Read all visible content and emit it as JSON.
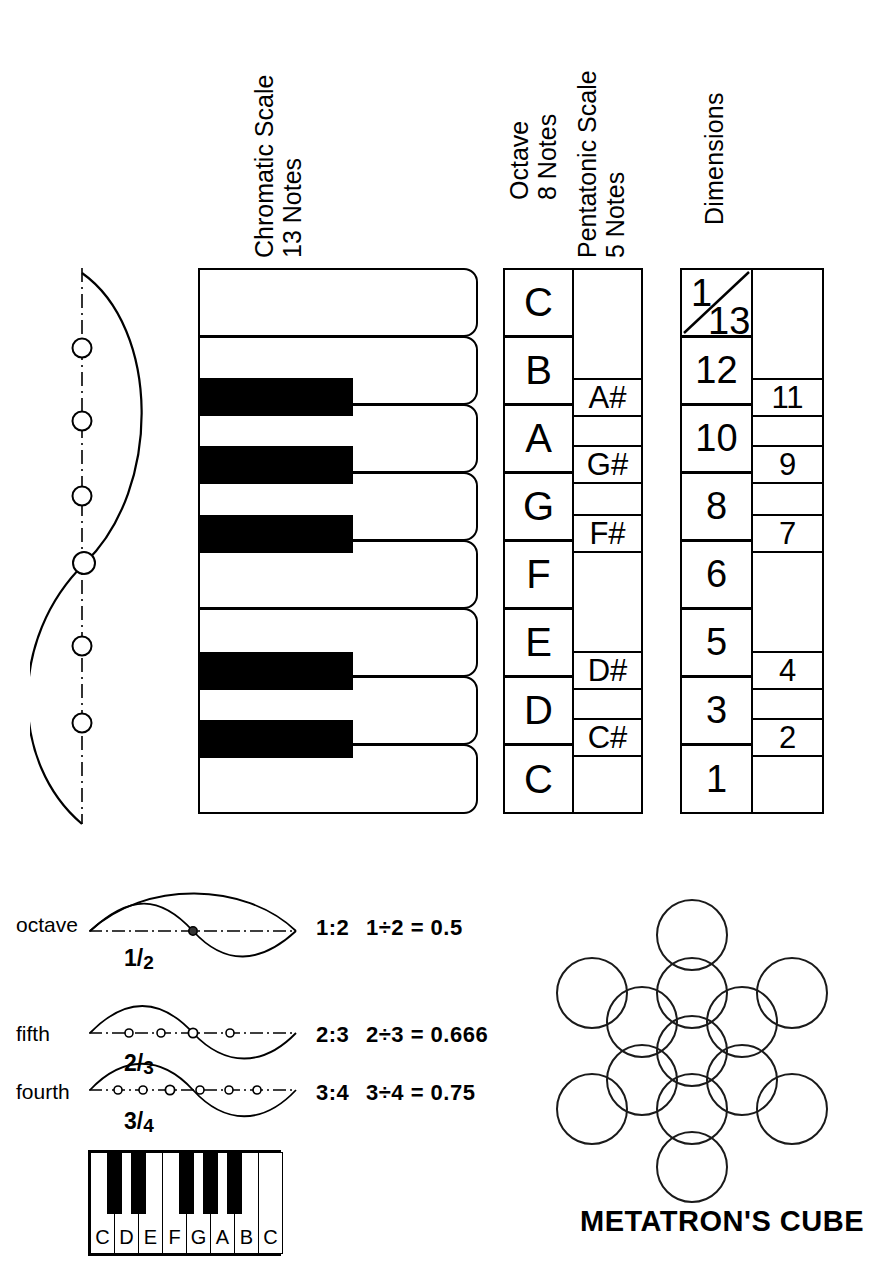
{
  "headers": {
    "chromatic": "Chromatic Scale\n13 Notes",
    "chromatic_line1": "Chromatic Scale",
    "chromatic_line2": "13 Notes",
    "octave_line1": "Octave",
    "octave_line2": "8 Notes",
    "pentatonic_line1": "Pentatonic Scale",
    "pentatonic_line2": "5 Notes",
    "dimensions": "Dimensions"
  },
  "octave_column": {
    "title": "Octave 8 Notes",
    "notes": [
      "C",
      "B",
      "A",
      "G",
      "F",
      "E",
      "D",
      "C"
    ]
  },
  "pentatonic_column": {
    "title": "Pentatonic Scale 5 Notes",
    "notes": [
      "A#",
      "G#",
      "F#",
      "D#",
      "C#"
    ]
  },
  "dimensions_column": {
    "title": "Dimensions",
    "left": [
      "1",
      "13",
      "12",
      "10",
      "8",
      "6",
      "5",
      "3",
      "1"
    ],
    "left_top_upper": "1",
    "left_top_lower": "13",
    "left_rest": [
      "12",
      "10",
      "8",
      "6",
      "5",
      "3",
      "1"
    ],
    "right": [
      "11",
      "9",
      "7",
      "4",
      "2"
    ]
  },
  "chromatic_keyboard": {
    "white_key_count": 8,
    "black_key_count": 5
  },
  "ratios": [
    {
      "name": "octave",
      "fraction_num": "1",
      "fraction_den": "2",
      "ratio": "1:2",
      "equation": "1÷2 = 0.5"
    },
    {
      "name": "fifth",
      "fraction_num": "2",
      "fraction_den": "3",
      "ratio": "2:3",
      "equation": "2÷3 = 0.666"
    },
    {
      "name": "fourth",
      "fraction_num": "3",
      "fraction_den": "4",
      "ratio": "3:4",
      "equation": "3÷4 = 0.75"
    }
  ],
  "small_keyboard": {
    "white_keys": [
      "C",
      "D",
      "E",
      "F",
      "G",
      "A",
      "B",
      "C"
    ],
    "black_key_count": 5
  },
  "metatron": {
    "title": "METATRON'S CUBE",
    "circle_count": 13
  },
  "colors": {
    "ink": "#000000",
    "paper": "#ffffff"
  }
}
